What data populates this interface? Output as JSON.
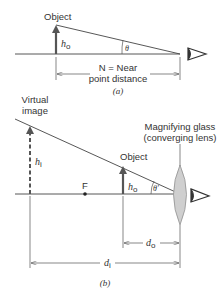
{
  "panel_a": {
    "object_label": "Object",
    "height_label": "h",
    "height_sub": "o",
    "angle_label": "θ",
    "distance_label_line1": "N = Near",
    "distance_label_line2": "point distance",
    "caption": "(a)"
  },
  "panel_b": {
    "virtual_image_line1": "Virtual",
    "virtual_image_line2": "image",
    "image_height_label": "h",
    "image_height_sub": "i",
    "focal_point_label": "F",
    "object_label": "Object",
    "object_height_label": "h",
    "object_height_sub": "o",
    "angle_label": "θ′",
    "lens_label_line1": "Magnifying glass",
    "lens_label_line2": "(converging lens)",
    "object_distance_label": "d",
    "object_distance_sub": "o",
    "image_distance_label": "d",
    "image_distance_sub": "i",
    "caption": "(b)"
  },
  "colors": {
    "line": "#444444",
    "arrow": "#555555",
    "lens_fill": "#cfcfcf"
  }
}
